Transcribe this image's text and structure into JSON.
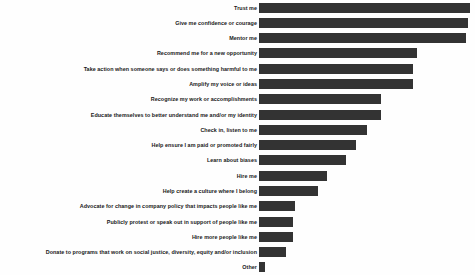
{
  "chart_data": {
    "type": "bar",
    "orientation": "horizontal",
    "title": "",
    "subtitle": "",
    "xlabel": "",
    "ylabel": "",
    "grid": false,
    "legend": null,
    "legend_position": "none",
    "axis_visible": false,
    "tick_labels_x": [],
    "bar_color": "#333333",
    "background_color": "#fefefe",
    "xlim": [
      0,
      100
    ],
    "value_unit": "relative percent of respondents",
    "categories": [
      "Trust me",
      "Give me confidence or courage",
      "Mentor me",
      "Recommend me for a new opportunity",
      "Take action when someone says or does something harmful to me",
      "Amplify my voice or ideas",
      "Recognize my work or accomplishments",
      "Educate themselves to better understand me and/or my identity",
      "Check in, listen to me",
      "Help ensure I am paid or promoted fairly",
      "Learn about biases",
      "Hire me",
      "Help create a culture where I belong",
      "Advocate for change in company policy that impacts people like me",
      "Publicly protest or speak out in support of people like me",
      "Hire more people like me",
      "Donate to programs that work on social justice, diversity, equity and/or inclusion",
      "Other"
    ],
    "values": [
      100,
      99,
      98,
      75,
      73,
      73,
      58,
      58,
      51,
      46,
      41,
      32,
      28,
      17,
      16,
      16,
      13,
      3
    ]
  }
}
